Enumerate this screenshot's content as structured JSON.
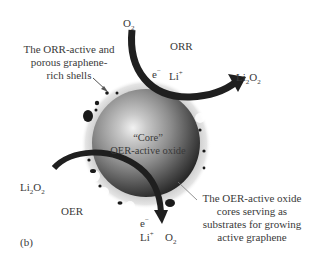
{
  "figure": {
    "panel_label": "(b)",
    "regions": {
      "orr": "ORR",
      "oer": "OER"
    },
    "core": {
      "line1": "“Core”",
      "line2": "OER-active oxide"
    },
    "annotations": {
      "shell": [
        "The ORR-active and",
        "porous graphene-",
        "rich shells"
      ],
      "oxide": [
        "The OER-active oxide",
        "cores serving as",
        "substrates for growing",
        "active graphene"
      ]
    },
    "species": {
      "o2_top": {
        "base": "O",
        "sub": "2"
      },
      "e_top": {
        "base": "e",
        "sup": "−"
      },
      "li_top": {
        "base": "Li",
        "sup": "+"
      },
      "li2o2_right": {
        "base1": "Li",
        "sub1": "2",
        "base2": "O",
        "sub2": "2"
      },
      "li2o2_left": {
        "base1": "Li",
        "sub1": "2",
        "base2": "O",
        "sub2": "2"
      },
      "e_bottom": {
        "base": "e",
        "sup": "−"
      },
      "li_bottom": {
        "base": "Li",
        "sup": "+"
      },
      "o2_bottom": {
        "base": "O",
        "sub": "2"
      }
    },
    "colors": {
      "arrow": "#1f1f1f",
      "sphere_light": "#e8e8e8",
      "sphere_mid": "#8a8a8a",
      "sphere_dark": "#2a2a2a",
      "shell": "#d6d6d6",
      "particles": "#1a1a1a",
      "text": "#3a3a3a"
    }
  }
}
